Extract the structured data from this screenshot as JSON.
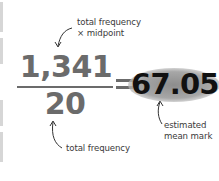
{
  "formula": {
    "numerator": "1,341",
    "denominator": "20",
    "operator": "=",
    "result": "67.05"
  },
  "annotations": {
    "numerator_label": [
      "total frequency",
      "× midpoint"
    ],
    "denominator_label": "total frequency",
    "result_label": [
      "estimated",
      "mean mark"
    ]
  },
  "colors": {
    "formula_gray": "#6b6b6b",
    "result_text": "#111111",
    "result_highlight": "#9a9a9a",
    "annotation_text": "#3a3a3a"
  }
}
